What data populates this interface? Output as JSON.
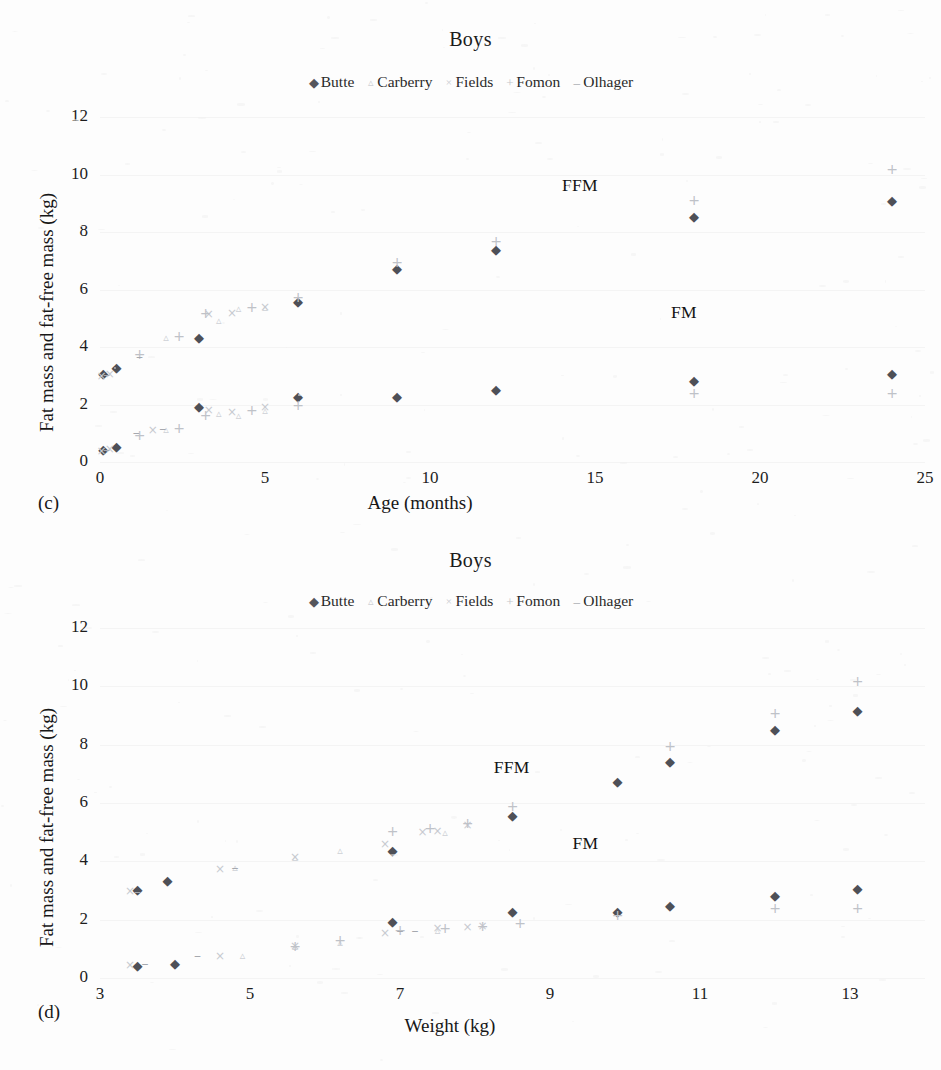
{
  "figure": {
    "background": "#fdfdfd",
    "series_colors": {
      "Butte": "#4e5057",
      "Carberry": "#ced1d6",
      "Fields": "#c7cad0",
      "Fomon": "#bfc2c8",
      "Olhager": "#a6a9af"
    },
    "series_markers": {
      "Butte": "◆",
      "Carberry": "▵",
      "Fields": "×",
      "Fomon": "+",
      "Olhager": "–"
    },
    "marker_names": {
      "Butte": "diamond-marker",
      "Carberry": "triangle-marker",
      "Fields": "x-marker",
      "Fomon": "plus-marker",
      "Olhager": "dash-marker"
    }
  },
  "panels": [
    {
      "tag": "(c)",
      "title": "Boys"
    },
    {
      "tag": "(d)",
      "title": "Boys"
    }
  ],
  "legend": {
    "entries": [
      {
        "label": "Butte",
        "marker": "◆",
        "cls": "lm-butte"
      },
      {
        "label": "Carberry",
        "marker": "▵",
        "cls": "lm-carberry"
      },
      {
        "label": "Fields",
        "marker": "×",
        "cls": "lm-fields"
      },
      {
        "label": "Fomon",
        "marker": "+",
        "cls": "lm-fomon"
      },
      {
        "label": "Olhager",
        "marker": "–",
        "cls": "lm-olhager"
      }
    ]
  },
  "chart_data": [
    {
      "panel": "(c)",
      "type": "scatter",
      "title": "Boys",
      "xlabel": "Age (months)",
      "ylabel": "Fat mass and fat-free mass (kg)",
      "xlim": [
        0,
        25
      ],
      "ylim": [
        0,
        12
      ],
      "xticks": [
        0,
        5,
        10,
        15,
        20,
        25
      ],
      "yticks": [
        0,
        2,
        4,
        6,
        8,
        10,
        12
      ],
      "grid": "horizontal-faint",
      "legend_position": "top-center",
      "annotations": [
        {
          "text": "FFM",
          "x": 14.0,
          "y": 9.6
        },
        {
          "text": "FM",
          "x": 17.3,
          "y": 5.2
        }
      ],
      "series": [
        {
          "name": "Butte",
          "measure": "FFM",
          "points": [
            [
              0.1,
              3.1
            ],
            [
              0.5,
              3.3
            ],
            [
              3,
              4.35
            ],
            [
              6,
              5.6
            ],
            [
              9,
              6.75
            ],
            [
              12,
              7.4
            ],
            [
              18,
              8.55
            ],
            [
              24,
              9.1
            ]
          ]
        },
        {
          "name": "Butte",
          "measure": "FM",
          "points": [
            [
              0.1,
              0.45
            ],
            [
              0.5,
              0.55
            ],
            [
              3,
              1.95
            ],
            [
              6,
              2.3
            ],
            [
              9,
              2.3
            ],
            [
              12,
              2.55
            ],
            [
              18,
              2.85
            ],
            [
              24,
              3.1
            ]
          ]
        },
        {
          "name": "Carberry",
          "measure": "FFM",
          "points": [
            [
              2.0,
              4.35
            ],
            [
              3.6,
              4.95
            ],
            [
              4.2,
              5.35
            ],
            [
              5.0,
              5.4
            ]
          ]
        },
        {
          "name": "Carberry",
          "measure": "FM",
          "points": [
            [
              2.0,
              1.15
            ],
            [
              3.6,
              1.7
            ],
            [
              4.2,
              1.65
            ],
            [
              5.0,
              1.8
            ]
          ]
        },
        {
          "name": "Fields",
          "measure": "FFM",
          "points": [
            [
              0.05,
              3.0
            ],
            [
              0.3,
              3.05
            ],
            [
              3.3,
              5.15
            ],
            [
              4.0,
              5.2
            ],
            [
              5.0,
              5.4
            ]
          ]
        },
        {
          "name": "Fields",
          "measure": "FM",
          "points": [
            [
              0.05,
              0.4
            ],
            [
              0.3,
              0.45
            ],
            [
              1.6,
              1.1
            ],
            [
              3.3,
              1.8
            ],
            [
              4.0,
              1.75
            ],
            [
              5.0,
              1.9
            ]
          ]
        },
        {
          "name": "Fomon",
          "measure": "FFM",
          "points": [
            [
              1.2,
              3.75
            ],
            [
              2.4,
              4.4
            ],
            [
              3.2,
              5.2
            ],
            [
              4.6,
              5.4
            ],
            [
              6,
              5.75
            ],
            [
              9,
              6.95
            ],
            [
              12,
              7.7
            ],
            [
              18,
              9.1
            ],
            [
              24,
              10.2
            ]
          ]
        },
        {
          "name": "Fomon",
          "measure": "FM",
          "points": [
            [
              1.2,
              0.95
            ],
            [
              2.4,
              1.2
            ],
            [
              3.2,
              1.65
            ],
            [
              4.6,
              1.8
            ],
            [
              6,
              2.0
            ],
            [
              18,
              2.4
            ],
            [
              24,
              2.4
            ]
          ]
        },
        {
          "name": "Olhager",
          "measure": "FFM",
          "points": [
            [
              0.2,
              3.05
            ],
            [
              1.2,
              3.7
            ]
          ]
        },
        {
          "name": "Olhager",
          "measure": "FM",
          "points": [
            [
              0.2,
              0.45
            ],
            [
              1.1,
              1.05
            ],
            [
              1.9,
              1.2
            ]
          ]
        }
      ]
    },
    {
      "panel": "(d)",
      "type": "scatter",
      "title": "Boys",
      "xlabel": "Weight (kg)",
      "ylabel": "Fat mass and fat-free mass (kg)",
      "xlim": [
        3,
        14
      ],
      "ylim": [
        0,
        12
      ],
      "xticks": [
        3,
        5,
        7,
        9,
        11,
        13
      ],
      "yticks": [
        0,
        2,
        4,
        6,
        8,
        10,
        12
      ],
      "grid": "horizontal-faint",
      "legend_position": "top-center",
      "annotations": [
        {
          "text": "FFM",
          "x": 8.25,
          "y": 7.2
        },
        {
          "text": "FM",
          "x": 9.3,
          "y": 4.6
        }
      ],
      "series": [
        {
          "name": "Butte",
          "measure": "FFM",
          "points": [
            [
              3.5,
              3.05
            ],
            [
              3.9,
              3.35
            ],
            [
              6.9,
              4.4
            ],
            [
              8.5,
              5.6
            ],
            [
              9.9,
              6.75
            ],
            [
              10.6,
              7.45
            ],
            [
              12.0,
              8.55
            ],
            [
              13.1,
              9.2
            ]
          ]
        },
        {
          "name": "Butte",
          "measure": "FM",
          "points": [
            [
              3.5,
              0.45
            ],
            [
              4.0,
              0.5
            ],
            [
              6.9,
              1.95
            ],
            [
              8.5,
              2.3
            ],
            [
              9.9,
              2.3
            ],
            [
              10.6,
              2.5
            ],
            [
              12.0,
              2.85
            ],
            [
              13.1,
              3.1
            ]
          ]
        },
        {
          "name": "Carberry",
          "measure": "FFM",
          "points": [
            [
              4.8,
              3.8
            ],
            [
              5.6,
              4.15
            ],
            [
              6.2,
              4.4
            ],
            [
              7.6,
              5.0
            ]
          ]
        },
        {
          "name": "Carberry",
          "measure": "FM",
          "points": [
            [
              4.9,
              0.8
            ],
            [
              5.6,
              1.1
            ],
            [
              6.2,
              1.25
            ],
            [
              7.5,
              1.65
            ]
          ]
        },
        {
          "name": "Fields",
          "measure": "FFM",
          "points": [
            [
              3.4,
              3.0
            ],
            [
              4.6,
              3.75
            ],
            [
              5.6,
              4.15
            ],
            [
              6.8,
              4.6
            ],
            [
              7.3,
              5.0
            ],
            [
              7.5,
              5.05
            ],
            [
              7.9,
              5.25
            ]
          ]
        },
        {
          "name": "Fields",
          "measure": "FM",
          "points": [
            [
              3.4,
              0.45
            ],
            [
              4.6,
              0.75
            ],
            [
              5.6,
              1.1
            ],
            [
              6.8,
              1.55
            ],
            [
              7.5,
              1.7
            ],
            [
              7.9,
              1.75
            ],
            [
              8.1,
              1.8
            ]
          ]
        },
        {
          "name": "Fomon",
          "measure": "FFM",
          "points": [
            [
              6.9,
              5.05
            ],
            [
              7.4,
              5.15
            ],
            [
              7.9,
              5.3
            ],
            [
              8.5,
              5.9
            ],
            [
              10.6,
              7.95
            ],
            [
              12.0,
              9.1
            ],
            [
              13.1,
              10.2
            ]
          ]
        },
        {
          "name": "Fomon",
          "measure": "FM",
          "points": [
            [
              5.6,
              1.1
            ],
            [
              6.2,
              1.3
            ],
            [
              7.0,
              1.65
            ],
            [
              7.6,
              1.7
            ],
            [
              8.1,
              1.8
            ],
            [
              8.6,
              1.9
            ],
            [
              9.9,
              2.15
            ],
            [
              12.0,
              2.4
            ],
            [
              13.1,
              2.4
            ]
          ]
        },
        {
          "name": "Olhager",
          "measure": "FFM",
          "points": [
            [
              3.5,
              3.0
            ],
            [
              4.8,
              3.8
            ]
          ]
        },
        {
          "name": "Olhager",
          "measure": "FM",
          "points": [
            [
              3.6,
              0.5
            ],
            [
              4.3,
              0.8
            ],
            [
              7.0,
              1.65
            ],
            [
              7.2,
              1.65
            ]
          ]
        }
      ]
    }
  ]
}
